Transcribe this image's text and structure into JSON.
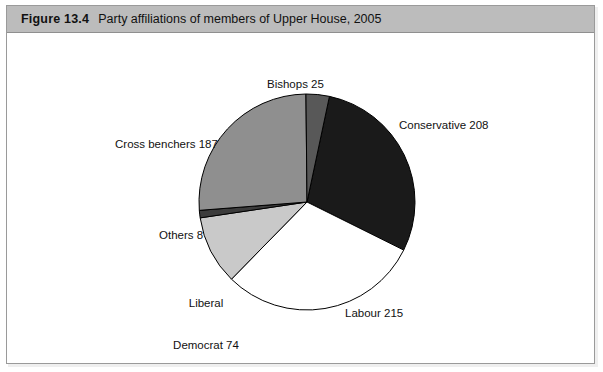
{
  "figure": {
    "number": "Figure 13.4",
    "caption": "Party affiliations of members of Upper House, 2005"
  },
  "chart_data": {
    "type": "pie",
    "title": "Party affiliations of members of Upper House, 2005",
    "xlabel": "",
    "ylabel": "",
    "total": 717,
    "start_angle_deg": 12,
    "direction": "clockwise",
    "legend": "none (labels placed around pie)",
    "grid": false,
    "categories": [
      "Conservative",
      "Labour",
      "Liberal Democrat",
      "Others",
      "Cross benchers",
      "Bishops"
    ],
    "values": [
      208,
      215,
      74,
      8,
      187,
      25
    ],
    "labels": [
      "Conservative 208",
      "Labour 215",
      "Liberal Democrat 74",
      "Others 8",
      "Cross benchers 187",
      "Bishops 25"
    ],
    "slices": [
      {
        "name": "Conservative",
        "value": 208,
        "label": "Conservative 208",
        "color": "#1a1a1a",
        "stroke": "#000000"
      },
      {
        "name": "Labour",
        "value": 215,
        "label": "Labour 215",
        "color": "#ffffff",
        "stroke": "#000000"
      },
      {
        "name": "Liberal Democrat",
        "value": 74,
        "label_line1": "Liberal",
        "label_line2": "Democrat 74",
        "label": "Liberal Democrat 74",
        "color": "#c9c9c9",
        "stroke": "#000000"
      },
      {
        "name": "Others",
        "value": 8,
        "label": "Others 8",
        "color": "#3c3c3c",
        "stroke": "#000000"
      },
      {
        "name": "Cross benchers",
        "value": 187,
        "label": "Cross benchers 187",
        "color": "#8f8f8f",
        "stroke": "#000000"
      },
      {
        "name": "Bishops",
        "value": 25,
        "label": "Bishops 25",
        "color": "#585858",
        "stroke": "#000000"
      }
    ]
  },
  "colors": {
    "caption_bar": "#bcbcbc",
    "frame_border": "#9a9a9a",
    "plot_background": "#ffffff",
    "text": "#111111"
  }
}
